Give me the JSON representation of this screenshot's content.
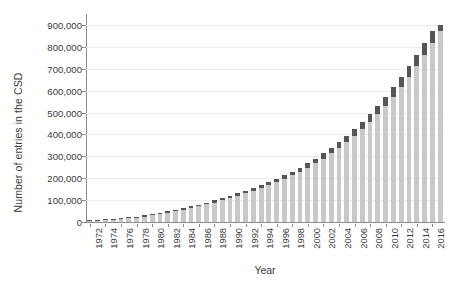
{
  "chart_data": {
    "type": "bar",
    "title": "",
    "xlabel": "Year",
    "ylabel": "Number of entries in the CSD",
    "grid": true,
    "legend_position": "none",
    "ylim": [
      0,
      950000
    ],
    "ytick_labels": [
      "0",
      "100,000",
      "200,000",
      "300,000",
      "400,000",
      "500,000",
      "600,000",
      "700,000",
      "800,000",
      "900,000"
    ],
    "ytick_values": [
      0,
      100000,
      200000,
      300000,
      400000,
      500000,
      600000,
      700000,
      800000,
      900000
    ],
    "xtick_labels": [
      "1972",
      "1974",
      "1976",
      "1978",
      "1980",
      "1982",
      "1984",
      "1986",
      "1988",
      "1990",
      "1992",
      "1994",
      "1996",
      "1998",
      "2000",
      "2002",
      "2004",
      "2006",
      "2008",
      "2010",
      "2012",
      "2014",
      "2016"
    ],
    "categories": [
      1972,
      1973,
      1974,
      1975,
      1976,
      1977,
      1978,
      1979,
      1980,
      1981,
      1982,
      1983,
      1984,
      1985,
      1986,
      1987,
      1988,
      1989,
      1990,
      1991,
      1992,
      1993,
      1994,
      1995,
      1996,
      1997,
      1998,
      1999,
      2000,
      2001,
      2002,
      2003,
      2004,
      2005,
      2006,
      2007,
      2008,
      2009,
      2010,
      2011,
      2012,
      2013,
      2014,
      2015,
      2016,
      2017
    ],
    "series": [
      {
        "name": "Cumulative entries at start of year",
        "color": "#c9c9c9",
        "values": [
          3000,
          5800,
          8400,
          11000,
          13800,
          17000,
          20500,
          24800,
          30000,
          35500,
          42000,
          48500,
          56000,
          63500,
          72000,
          80000,
          89000,
          98500,
          109000,
          120000,
          131500,
          143000,
          155000,
          168000,
          182000,
          197000,
          213000,
          230000,
          248000,
          268000,
          290000,
          313000,
          338000,
          365000,
          394000,
          425000,
          459000,
          494000,
          532000,
          573000,
          616000,
          662000,
          711000,
          762000,
          817000,
          872000
        ]
      },
      {
        "name": "New entries added during year",
        "color": "#555555",
        "values": [
          2800,
          2600,
          2600,
          2800,
          3200,
          3500,
          4300,
          5200,
          5500,
          6500,
          6500,
          7500,
          7500,
          8500,
          8000,
          9000,
          9500,
          10500,
          11000,
          11500,
          11500,
          12000,
          13000,
          14000,
          15000,
          16000,
          17000,
          18000,
          20000,
          22000,
          23000,
          25000,
          27000,
          29000,
          31000,
          34000,
          35000,
          38000,
          41000,
          43000,
          46000,
          49000,
          51000,
          55000,
          55000,
          28000
        ]
      }
    ],
    "totals": [
      5800,
      8400,
      11000,
      13800,
      17000,
      20500,
      24800,
      30000,
      35500,
      42000,
      48500,
      56000,
      63500,
      72000,
      80000,
      89000,
      98500,
      109000,
      120000,
      131500,
      143000,
      155000,
      168000,
      182000,
      197000,
      213000,
      230000,
      248000,
      268000,
      290000,
      313000,
      338000,
      365000,
      394000,
      425000,
      459000,
      494000,
      532000,
      573000,
      616000,
      662000,
      711000,
      762000,
      817000,
      872000,
      900000
    ]
  }
}
